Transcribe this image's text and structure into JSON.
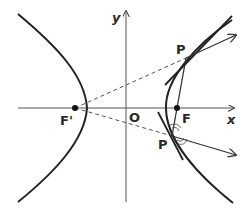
{
  "figure": {
    "type": "hyperbola-reflection-property",
    "colors": {
      "ink": "#222222",
      "axis": "#555555",
      "dash": "#555555",
      "background": "#ffffff"
    }
  },
  "labels": {
    "y_axis": "y",
    "x_axis": "x",
    "origin": "O",
    "focus_left": "F'",
    "focus_right": "F",
    "point_upper": "P",
    "point_lower": "P"
  }
}
